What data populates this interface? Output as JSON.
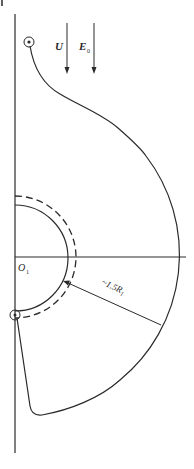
{
  "diagram": {
    "labels": {
      "velocity": "U",
      "field": "E",
      "field_sub": "0",
      "origin": "O",
      "origin_sub": "1",
      "radius_prefix": "~1.5",
      "radius_symbol": "R",
      "radius_sub": "1"
    },
    "colors": {
      "stroke": "#2a2a2a",
      "background": "#ffffff"
    },
    "geometry": {
      "origin": [
        14,
        257
      ],
      "inner_radius": 52,
      "dashed_radius": 60,
      "outer_radius": 162
    }
  }
}
